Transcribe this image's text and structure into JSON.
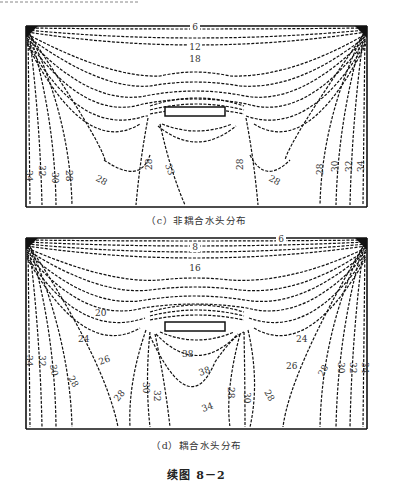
{
  "page": {
    "figure_title": "续图 8－2"
  },
  "figures": [
    {
      "id": "c",
      "caption": "（c）非耦合水头分布",
      "labels": {
        "top_1": "6",
        "top_2": "12",
        "top_3": "18",
        "left_34": "34",
        "left_32": "32",
        "left_30": "30",
        "left_28": "28",
        "mid_left_28": "28",
        "center_28": "28",
        "center_33": "33",
        "right_28a": "28",
        "right_28b": "28",
        "right_28c": "28",
        "right_30": "30",
        "right_32": "32",
        "right_34": "34"
      }
    },
    {
      "id": "d",
      "caption": "（d）耦合水头分布",
      "labels": {
        "top_6": "6",
        "top_8": "8",
        "top_16": "16",
        "left_20": "20",
        "left_24": "24",
        "left_26": "26",
        "right_24": "24",
        "right_26": "26",
        "inner_38a": "38",
        "inner_38b": "38",
        "inner_34": "34",
        "left_34": "34",
        "left_32": "32",
        "left_30": "30",
        "left_28": "28",
        "mid_28": "28",
        "mid_30": "30",
        "mid_32": "32",
        "rmid_28": "28",
        "rmid_30": "30",
        "rmid_28b": "28",
        "right_28": "28",
        "right_30": "30",
        "right_32": "32",
        "right_34": "34"
      }
    }
  ]
}
